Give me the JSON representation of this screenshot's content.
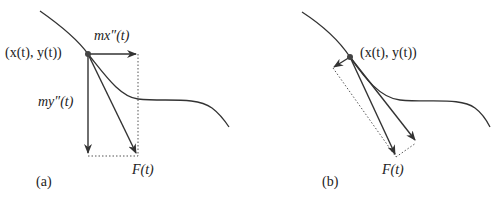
{
  "figure": {
    "panel_a": {
      "caption": "(a)",
      "point_label": "(x(t), y(t))",
      "horizontal_component_label": "mx″(t)",
      "vertical_component_label": "my″(t)",
      "force_label": "F(t)"
    },
    "panel_b": {
      "caption": "(b)",
      "point_label": "(x(t), y(t))",
      "force_label": "F(t)"
    },
    "colors": {
      "stroke": "#333333",
      "dotted": "#555555",
      "text": "#222222"
    }
  }
}
